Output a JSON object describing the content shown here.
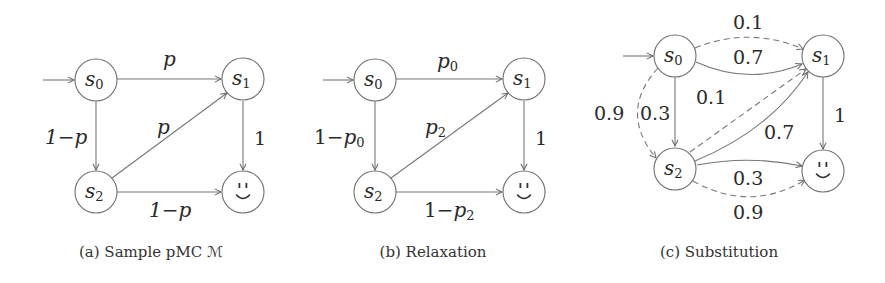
{
  "figure": {
    "panels": [
      {
        "id": "a",
        "caption": "(a) Sample pMC ℳ",
        "states": [
          {
            "id": "s0",
            "label": "s",
            "sub": "0",
            "initial": true
          },
          {
            "id": "s1",
            "label": "s",
            "sub": "1"
          },
          {
            "id": "s2",
            "label": "s",
            "sub": "2"
          },
          {
            "id": "goal",
            "label": "smiley",
            "icon": "smiley-face-icon"
          }
        ],
        "edges": [
          {
            "from": "s0",
            "to": "s1",
            "label": "p",
            "style": "solid"
          },
          {
            "from": "s0",
            "to": "s2",
            "label": "1−p",
            "style": "solid"
          },
          {
            "from": "s2",
            "to": "s1",
            "label": "p",
            "style": "solid"
          },
          {
            "from": "s2",
            "to": "goal",
            "label": "1−p",
            "style": "solid"
          },
          {
            "from": "s1",
            "to": "goal",
            "label": "1",
            "style": "solid"
          }
        ],
        "labels": {
          "s0_s1": "p",
          "s0_s2": "1−p",
          "s2_s1": "p",
          "s2_goal": "1−p",
          "s1_goal": "1"
        }
      },
      {
        "id": "b",
        "caption": "(b) Relaxation",
        "states": [
          {
            "id": "s0",
            "label": "s",
            "sub": "0",
            "initial": true
          },
          {
            "id": "s1",
            "label": "s",
            "sub": "1"
          },
          {
            "id": "s2",
            "label": "s",
            "sub": "2"
          },
          {
            "id": "goal",
            "label": "smiley",
            "icon": "smiley-face-icon"
          }
        ],
        "edges": [
          {
            "from": "s0",
            "to": "s1",
            "label": "p0",
            "style": "solid"
          },
          {
            "from": "s0",
            "to": "s2",
            "label": "1−p0",
            "style": "solid"
          },
          {
            "from": "s2",
            "to": "s1",
            "label": "p2",
            "style": "solid"
          },
          {
            "from": "s2",
            "to": "goal",
            "label": "1−p2",
            "style": "solid"
          },
          {
            "from": "s1",
            "to": "goal",
            "label": "1",
            "style": "solid"
          }
        ],
        "labels": {
          "s0_s1_base": "p",
          "s0_s1_sub": "0",
          "s0_s2_pre": "1−",
          "s0_s2_base": "p",
          "s0_s2_sub": "0",
          "s2_s1_base": "p",
          "s2_s1_sub": "2",
          "s2_goal_pre": "1−",
          "s2_goal_base": "p",
          "s2_goal_sub": "2",
          "s1_goal": "1"
        }
      },
      {
        "id": "c",
        "caption": "(c) Substitution",
        "states": [
          {
            "id": "s0",
            "label": "s",
            "sub": "0",
            "initial": true
          },
          {
            "id": "s1",
            "label": "s",
            "sub": "1"
          },
          {
            "id": "s2",
            "label": "s",
            "sub": "2"
          },
          {
            "id": "goal",
            "label": "smiley",
            "icon": "smiley-face-icon"
          }
        ],
        "edges": [
          {
            "from": "s0",
            "to": "s1",
            "label": "0.1",
            "style": "dashed"
          },
          {
            "from": "s0",
            "to": "s1",
            "label": "0.7",
            "style": "solid"
          },
          {
            "from": "s0",
            "to": "s2",
            "label": "0.9",
            "style": "dashed"
          },
          {
            "from": "s0",
            "to": "s2",
            "label": "0.3",
            "style": "solid"
          },
          {
            "from": "s2",
            "to": "s1",
            "label": "0.1",
            "style": "dashed"
          },
          {
            "from": "s2",
            "to": "s1",
            "label": "0.7",
            "style": "solid"
          },
          {
            "from": "s2",
            "to": "goal",
            "label": "0.3",
            "style": "solid"
          },
          {
            "from": "s2",
            "to": "goal",
            "label": "0.9",
            "style": "dashed"
          },
          {
            "from": "s1",
            "to": "goal",
            "label": "1",
            "style": "solid"
          }
        ],
        "labels": {
          "s0_s1_dashed": "0.1",
          "s0_s1_solid": "0.7",
          "s0_s2_dashed": "0.9",
          "s0_s2_solid": "0.3",
          "s2_s1_dashed": "0.1",
          "s2_s1_solid": "0.7",
          "s2_goal_solid": "0.3",
          "s2_goal_dashed": "0.9",
          "s1_goal": "1"
        }
      }
    ],
    "state_text": {
      "base": "s",
      "sub0": "0",
      "sub1": "1",
      "sub2": "2"
    },
    "colors": {
      "line": "#777777",
      "text": "#2a2a2a",
      "background": "#ffffff"
    }
  }
}
